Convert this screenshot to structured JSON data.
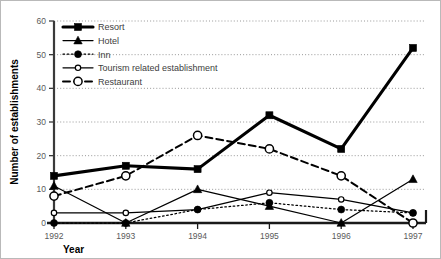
{
  "chart_data": {
    "type": "line",
    "title": "",
    "xlabel": "Year",
    "ylabel": "Number of establishments",
    "categories": [
      "1992",
      "1993",
      "1994",
      "1995",
      "1996",
      "1997"
    ],
    "x": [
      1992,
      1993,
      1994,
      1995,
      1996,
      1997
    ],
    "ylim": [
      0,
      60
    ],
    "yticks": [
      0,
      10,
      20,
      30,
      40,
      50,
      60
    ],
    "ytick_labels": [
      "0",
      "10",
      "20",
      "30",
      "40",
      "50",
      "60"
    ],
    "grid": "horizontal-dotted",
    "legend_position": "top-left-inside",
    "series": [
      {
        "name": "Resort",
        "values": [
          14,
          17,
          16,
          32,
          22,
          52
        ],
        "marker": "filled-square",
        "line_style": "solid",
        "line_width": "thick",
        "color": "#000000"
      },
      {
        "name": "Hotel",
        "values": [
          11,
          0,
          10,
          5,
          0,
          13
        ],
        "marker": "filled-triangle",
        "line_style": "solid",
        "line_width": "thin",
        "color": "#000000"
      },
      {
        "name": "Inn",
        "values": [
          0,
          0,
          4,
          6,
          4,
          3
        ],
        "marker": "filled-circle",
        "line_style": "dotted",
        "line_width": "thin",
        "color": "#000000"
      },
      {
        "name": "Tourism related establishment",
        "values": [
          3,
          3,
          4,
          9,
          7,
          3
        ],
        "marker": "open-circle-small",
        "line_style": "solid",
        "line_width": "thin",
        "color": "#000000"
      },
      {
        "name": "Restaurant",
        "values": [
          8,
          14,
          26,
          22,
          14,
          0
        ],
        "marker": "open-circle",
        "line_style": "dashed",
        "line_width": "medium",
        "color": "#000000"
      }
    ]
  },
  "legend": {
    "items": [
      {
        "label": "Resort"
      },
      {
        "label": "Hotel"
      },
      {
        "label": "Inn"
      },
      {
        "label": "Tourism related establishment"
      },
      {
        "label": "Restaurant"
      }
    ]
  }
}
